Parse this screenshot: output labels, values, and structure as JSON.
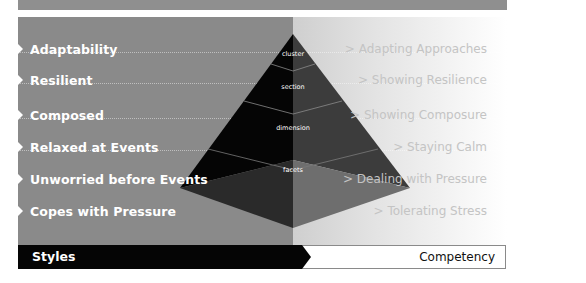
{
  "diagram": {
    "top_bar": {
      "color": "#8f8f8f"
    },
    "styles": [
      {
        "label": "Adaptability"
      },
      {
        "label": "Resilient"
      },
      {
        "label": "Composed"
      },
      {
        "label": "Relaxed at Events"
      },
      {
        "label": "Unworried before Events"
      },
      {
        "label": "Copes with Pressure"
      }
    ],
    "competencies": [
      {
        "label": "> Adapting Approaches"
      },
      {
        "label": "> Showing Resilience"
      },
      {
        "label": "> Showing Composure"
      },
      {
        "label": "> Staying Calm"
      },
      {
        "label": "> Dealing with Pressure"
      },
      {
        "label": "> Tolerating Stress"
      }
    ],
    "pyramid": {
      "levels": [
        {
          "label": "cluster"
        },
        {
          "label": "section"
        },
        {
          "label": "dimension"
        },
        {
          "label": "facets"
        }
      ]
    },
    "footer": {
      "left_label": "Styles",
      "right_label": "Competency"
    },
    "colors": {
      "left_panel": "#8a8a8a",
      "right_panel_start": "#cfcfcf",
      "right_panel_end": "#ffffff",
      "pyramid_dark": "#050505",
      "pyramid_mid": "#3a3a3a",
      "styles_bar": "#050505"
    }
  }
}
